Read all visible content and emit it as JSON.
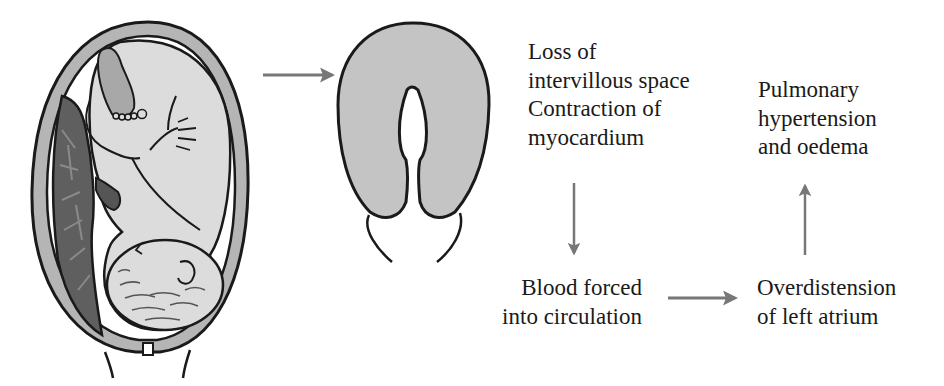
{
  "diagram": {
    "type": "flow",
    "illustrations": [
      {
        "id": "uterus-with-fetus",
        "description": "Uterus containing fetus with placenta on left wall"
      },
      {
        "id": "contracted-uterus",
        "description": "Contracted uterus (U-shaped cross-section)"
      }
    ],
    "colors": {
      "outline": "#1a1a1a",
      "uterine_wall": "#b5b5b5",
      "fetus_fill": "#dcdcdc",
      "placenta": "#5f5f5f",
      "cord": "#555555",
      "uterus_fill": "#c4c4c4",
      "arrow": "#777777",
      "text": "#1a1a1a"
    },
    "nodes": {
      "cause": {
        "lines": [
          "Loss of",
          "intervillous space",
          "Contraction of",
          "myocardium"
        ]
      },
      "blood": {
        "lines": [
          "Blood forced",
          "into circulation"
        ]
      },
      "atrium": {
        "lines": [
          "Overdistension",
          "of left atrium"
        ]
      },
      "outcome": {
        "lines": [
          "Pulmonary",
          "hypertension",
          "and oedema"
        ]
      }
    },
    "edges": [
      {
        "from": "uterus-with-fetus",
        "to": "contracted-uterus",
        "direction": "right"
      },
      {
        "from": "cause",
        "to": "blood",
        "direction": "down"
      },
      {
        "from": "blood",
        "to": "atrium",
        "direction": "right"
      },
      {
        "from": "atrium",
        "to": "outcome",
        "direction": "up"
      }
    ]
  }
}
